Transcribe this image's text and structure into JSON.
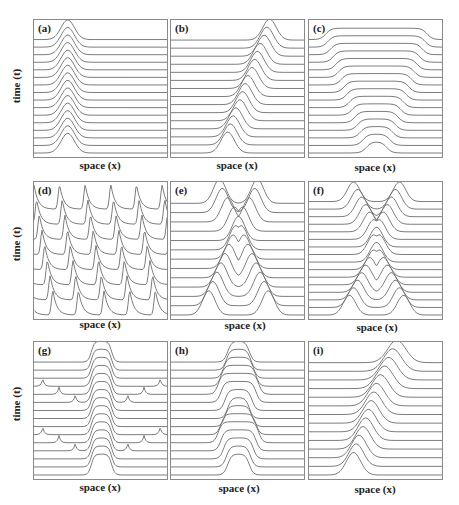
{
  "figure": {
    "stroke_color": "#6e6e6e",
    "frame_color": "#8a8a8a",
    "xlabel": "space (x)",
    "ylabel": "time (t)"
  },
  "panels": [
    {
      "id": "a",
      "label": "(a)",
      "col": 0,
      "row": 0,
      "kind": "stationary_pulse",
      "lines": 16
    },
    {
      "id": "b",
      "label": "(b)",
      "col": 1,
      "row": 0,
      "kind": "moving_pulse",
      "lines": 15
    },
    {
      "id": "c",
      "label": "(c)",
      "col": 2,
      "row": 0,
      "kind": "spreading_front",
      "lines": 16
    },
    {
      "id": "d",
      "label": "(d)",
      "col": 0,
      "row": 1,
      "kind": "periodic_train",
      "lines": 8
    },
    {
      "id": "e",
      "label": "(e)",
      "col": 1,
      "row": 1,
      "kind": "colliding_pulses_reflect",
      "lines": 13
    },
    {
      "id": "f",
      "label": "(f)",
      "col": 2,
      "row": 1,
      "kind": "colliding_pulses_pass",
      "lines": 16
    },
    {
      "id": "g",
      "label": "(g)",
      "col": 0,
      "row": 2,
      "kind": "pulse_with_emitted_spikes",
      "lines": 15
    },
    {
      "id": "h",
      "label": "(h)",
      "col": 1,
      "row": 2,
      "kind": "breathing_pulse",
      "lines": 15
    },
    {
      "id": "i",
      "label": "(i)",
      "col": 2,
      "row": 2,
      "kind": "accelerating_pulse",
      "lines": 14
    }
  ],
  "chart_data": [
    {
      "type": "line",
      "title": "(a)",
      "xlabel": "space (x)",
      "ylabel": "time (t)",
      "description": "Stationary localized pulse at x≈0.25 repeated over 16 time slices",
      "series": [
        {
          "name": "pulse_center",
          "values": [
            0.25,
            0.25,
            0.25,
            0.25,
            0.25,
            0.25,
            0.25,
            0.25,
            0.25,
            0.25,
            0.25,
            0.25,
            0.25,
            0.25,
            0.25,
            0.25
          ]
        }
      ]
    },
    {
      "type": "line",
      "title": "(b)",
      "xlabel": "space (x)",
      "ylabel": "",
      "description": "Pulse traveling right from x≈0.42 to x≈0.73 over 15 time slices",
      "series": [
        {
          "name": "pulse_center",
          "values": [
            0.42,
            0.44,
            0.46,
            0.48,
            0.51,
            0.53,
            0.55,
            0.57,
            0.6,
            0.62,
            0.64,
            0.66,
            0.69,
            0.71,
            0.73
          ]
        }
      ]
    },
    {
      "type": "line",
      "title": "(c)",
      "xlabel": "space (x)",
      "ylabel": "",
      "description": "Plateau region widening symmetrically from width≈0.15 to width≈0.75 over 16 time slices",
      "series": [
        {
          "name": "plateau_width",
          "values": [
            0.15,
            0.2,
            0.24,
            0.28,
            0.32,
            0.36,
            0.4,
            0.44,
            0.48,
            0.52,
            0.56,
            0.6,
            0.64,
            0.68,
            0.72,
            0.75
          ]
        }
      ]
    },
    {
      "type": "line",
      "title": "(d)",
      "xlabel": "space (x)",
      "ylabel": "time (t)",
      "description": "Periodic train of 5 pulses drifting left over 8 time slices",
      "series": [
        {
          "name": "train_shift",
          "values": [
            0.0,
            -0.02,
            -0.04,
            -0.06,
            -0.08,
            -0.1,
            -0.12,
            -0.14
          ]
        }
      ]
    },
    {
      "type": "line",
      "title": "(e)",
      "xlabel": "space (x)",
      "ylabel": "",
      "description": "Two pulses approach, merge near center and separate",
      "series": [
        {
          "name": "left_pulse_center",
          "values": [
            0.28,
            0.31,
            0.34,
            0.37,
            0.4,
            0.43,
            0.46,
            0.48,
            0.5,
            0.47,
            0.42,
            0.38,
            0.36
          ]
        },
        {
          "name": "right_pulse_center",
          "values": [
            0.72,
            0.69,
            0.66,
            0.63,
            0.6,
            0.57,
            0.54,
            0.52,
            0.5,
            0.53,
            0.58,
            0.62,
            0.64
          ]
        }
      ]
    },
    {
      "type": "line",
      "title": "(f)",
      "xlabel": "space (x)",
      "ylabel": "",
      "description": "Two pulses collide at center and pass through each other",
      "series": [
        {
          "name": "left_pulse_center",
          "values": [
            0.3,
            0.33,
            0.36,
            0.39,
            0.42,
            0.45,
            0.48,
            0.5,
            0.52,
            0.5,
            0.48,
            0.45,
            0.42,
            0.39,
            0.36,
            0.33
          ]
        },
        {
          "name": "right_pulse_center",
          "values": [
            0.7,
            0.67,
            0.64,
            0.61,
            0.58,
            0.55,
            0.52,
            0.5,
            0.48,
            0.5,
            0.52,
            0.55,
            0.58,
            0.61,
            0.64,
            0.67
          ]
        }
      ]
    },
    {
      "type": "line",
      "title": "(g)",
      "xlabel": "space (x)",
      "ylabel": "time (t)",
      "description": "Stationary flat-top pulse at center emitting small spikes that propagate outward in two bursts",
      "series": [
        {
          "name": "spike_offset",
          "values": [
            null,
            null,
            null,
            0.1,
            0.22,
            0.34,
            0.45,
            null,
            null,
            0.1,
            0.22,
            0.34,
            0.45,
            null,
            null
          ]
        }
      ]
    },
    {
      "type": "line",
      "title": "(h)",
      "xlabel": "space (x)",
      "ylabel": "",
      "description": "Flat-top pulse at center breathing (width oscillating)",
      "series": [
        {
          "name": "width",
          "values": [
            0.16,
            0.18,
            0.22,
            0.26,
            0.3,
            0.26,
            0.2,
            0.16,
            0.2,
            0.26,
            0.3,
            0.26,
            0.22,
            0.18,
            0.16
          ]
        }
      ]
    },
    {
      "type": "line",
      "title": "(i)",
      "xlabel": "space (x)",
      "ylabel": "",
      "description": "Pulse moving right while broadening",
      "series": [
        {
          "name": "pulse_center",
          "values": [
            0.33,
            0.35,
            0.37,
            0.4,
            0.42,
            0.44,
            0.46,
            0.48,
            0.5,
            0.53,
            0.56,
            0.59,
            0.62,
            0.65
          ]
        }
      ]
    }
  ]
}
